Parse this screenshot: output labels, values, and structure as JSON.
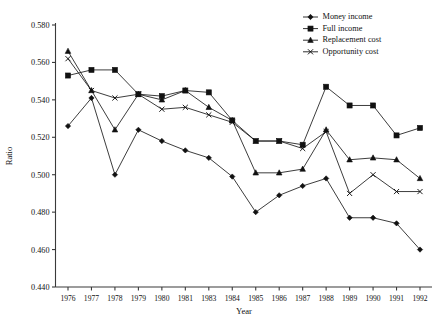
{
  "chart_data": {
    "type": "line",
    "title": "",
    "xlabel": "Year",
    "ylabel": "Ratio",
    "grid": false,
    "legend_position": "top-right",
    "categories": [
      "1976",
      "1977",
      "1978",
      "1979",
      "1980",
      "1981",
      "1983",
      "1984",
      "1985",
      "1986",
      "1987",
      "1988",
      "1989",
      "1990",
      "1991",
      "1992"
    ],
    "ylim": [
      0.44,
      0.58
    ],
    "ytick_labels": [
      "0.580",
      "0.560",
      "0.540",
      "0.520",
      "0.500",
      "0.480",
      "0.460",
      "0.440"
    ],
    "ytick_values": [
      0.58,
      0.56,
      0.54,
      0.52,
      0.5,
      0.48,
      0.46,
      0.44
    ],
    "ytick_step": 0.02,
    "series": [
      {
        "name": "Money income",
        "marker": "diamond",
        "values": [
          0.526,
          0.541,
          0.5,
          0.524,
          0.518,
          0.513,
          0.509,
          0.499,
          0.48,
          0.489,
          0.494,
          0.498,
          0.477,
          0.477,
          0.474,
          0.46
        ]
      },
      {
        "name": "Full income",
        "marker": "square",
        "values": [
          0.553,
          0.556,
          0.556,
          0.543,
          0.542,
          0.545,
          0.544,
          0.529,
          0.518,
          0.518,
          0.516,
          0.547,
          0.537,
          0.537,
          0.521,
          0.525
        ]
      },
      {
        "name": "Replacement cost",
        "marker": "triangle",
        "values": [
          0.566,
          0.545,
          0.524,
          0.543,
          0.54,
          0.545,
          0.536,
          0.529,
          0.501,
          0.501,
          0.503,
          0.524,
          0.508,
          0.509,
          0.508,
          0.498
        ]
      },
      {
        "name": "Opportunity cost",
        "marker": "x",
        "values": [
          0.562,
          0.545,
          0.541,
          0.543,
          0.535,
          0.536,
          0.532,
          0.528,
          0.518,
          0.518,
          0.514,
          0.523,
          0.49,
          0.5,
          0.491,
          0.491
        ]
      }
    ]
  },
  "axes": {
    "y_axis_title": "Ratio",
    "x_axis_title": "Year"
  },
  "legend": {
    "entries": [
      {
        "label": "Money income",
        "marker": "diamond"
      },
      {
        "label": "Full income",
        "marker": "square"
      },
      {
        "label": "Replacement cost",
        "marker": "triangle"
      },
      {
        "label": "Opportunity cost",
        "marker": "x"
      }
    ]
  },
  "colors": {
    "ink": "#111111",
    "axis": "#3a3a3a",
    "background": "#ffffff"
  }
}
